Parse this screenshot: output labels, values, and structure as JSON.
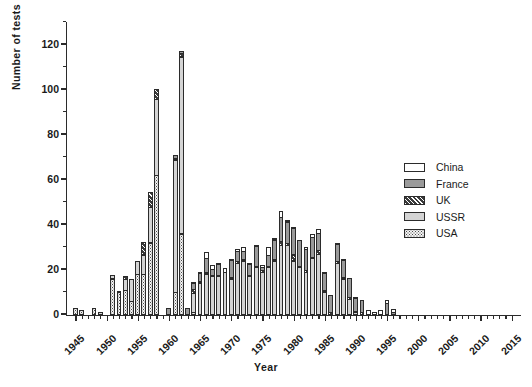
{
  "chart_data": {
    "type": "bar",
    "subtype": "stacked-bar",
    "title": "",
    "xlabel": "Year",
    "ylabel": "Number of tests",
    "xlim": [
      1943.5,
      2016.5
    ],
    "ylim": [
      0,
      130
    ],
    "y_major_ticks": [
      0,
      20,
      40,
      60,
      80,
      100,
      120
    ],
    "y_minor_tick_step": 10,
    "x_tick_labels": [
      "1945",
      "1950",
      "1955",
      "1960",
      "1965",
      "1970",
      "1975",
      "1980",
      "1985",
      "1990",
      "1995",
      "2000",
      "2005",
      "2010",
      "2015"
    ],
    "x_tick_step": 5,
    "x_minor_tick_step": 1,
    "grid": false,
    "legend_position": "right",
    "series": [
      {
        "name": "China",
        "pattern": "open-white",
        "color": "#ffffff",
        "values": {
          "1964": 1,
          "1965": 1,
          "1966": 3,
          "1967": 2,
          "1968": 1,
          "1969": 2,
          "1970": 1,
          "1971": 1,
          "1972": 2,
          "1973": 1,
          "1974": 1,
          "1975": 1,
          "1976": 4,
          "1977": 1,
          "1978": 3,
          "1979": 1,
          "1980": 1,
          "1982": 1,
          "1983": 2,
          "1984": 2,
          "1985": 1,
          "1987": 1,
          "1988": 1,
          "1990": 1,
          "1992": 2,
          "1993": 1,
          "1994": 2,
          "1995": 2,
          "1996": 2
        }
      },
      {
        "name": "France",
        "pattern": "solid-gray",
        "color": "#9a9a9a",
        "values": {
          "1960": 3,
          "1961": 2,
          "1962": 1,
          "1963": 3,
          "1964": 3,
          "1965": 4,
          "1966": 7,
          "1967": 3,
          "1968": 5,
          "1969": 0,
          "1970": 8,
          "1971": 5,
          "1972": 4,
          "1973": 5,
          "1974": 9,
          "1975": 2,
          "1976": 5,
          "1977": 9,
          "1978": 11,
          "1979": 10,
          "1980": 12,
          "1981": 12,
          "1982": 10,
          "1983": 9,
          "1984": 8,
          "1985": 8,
          "1986": 8,
          "1987": 8,
          "1988": 8,
          "1989": 9,
          "1990": 6,
          "1991": 6,
          "1995": 5,
          "1996": 1
        }
      },
      {
        "name": "UK",
        "pattern": "diagonal-hatch-dark",
        "color": "#3a3a3a",
        "values": {
          "1952": 1,
          "1953": 2,
          "1956": 6,
          "1957": 7,
          "1958": 5,
          "1961": 1,
          "1962": 2,
          "1963": 0,
          "1964": 2,
          "1965": 1,
          "1966": 1,
          "1967": 1,
          "1968": 1,
          "1970": 1,
          "1971": 1,
          "1972": 1,
          "1973": 1,
          "1974": 1,
          "1975": 1,
          "1976": 1,
          "1977": 1,
          "1978": 2,
          "1979": 1,
          "1980": 3,
          "1981": 1,
          "1982": 1,
          "1983": 1,
          "1984": 2,
          "1985": 1,
          "1986": 1,
          "1987": 1,
          "1988": 1,
          "1989": 1,
          "1990": 1,
          "1991": 1
        }
      },
      {
        "name": "USSR",
        "pattern": "light-gray",
        "color": "#d4d4d4",
        "values": {
          "1949": 1,
          "1951": 2,
          "1953": 5,
          "1954": 10,
          "1955": 6,
          "1956": 9,
          "1957": 16,
          "1958": 34,
          "1961": 59,
          "1962": 79,
          "1963": 0,
          "1964": 9,
          "1965": 14,
          "1966": 18,
          "1967": 17,
          "1968": 17,
          "1969": 19,
          "1970": 16,
          "1971": 23,
          "1972": 24,
          "1973": 17,
          "1974": 21,
          "1975": 19,
          "1976": 21,
          "1977": 24,
          "1978": 31,
          "1979": 31,
          "1980": 24,
          "1981": 21,
          "1982": 19,
          "1983": 25,
          "1984": 27,
          "1985": 10,
          "1987": 23,
          "1988": 16,
          "1989": 7,
          "1990": 1
        }
      },
      {
        "name": "USA",
        "pattern": "fine-dot",
        "color": "#f2f2f2",
        "values": {
          "1945": 3,
          "1946": 2,
          "1948": 3,
          "1949": 0,
          "1951": 16,
          "1952": 10,
          "1953": 11,
          "1954": 6,
          "1955": 18,
          "1956": 18,
          "1957": 32,
          "1958": 62,
          "1959": 0,
          "1960": 0,
          "1961": 10,
          "1962": 36,
          "1963": 0,
          "1964": 1,
          "1965": 0,
          "1966": 0,
          "1967": 0,
          "1968": 0,
          "1969": 0,
          "1970": 0,
          "1971": 0,
          "1972": 0,
          "1973": 0,
          "1974": 0,
          "1975": 0,
          "1976": 0
        }
      }
    ],
    "annotations": [
      {
        "year": 1958,
        "total": 102,
        "note": "secondary peak"
      },
      {
        "year": 1962,
        "total": 118,
        "note": "overall peak"
      }
    ]
  },
  "legend": {
    "items": [
      {
        "label": "China",
        "series_key": "China"
      },
      {
        "label": "France",
        "series_key": "France"
      },
      {
        "label": "UK",
        "series_key": "UK"
      },
      {
        "label": "USSR",
        "series_key": "USSR"
      },
      {
        "label": "USA",
        "series_key": "USA"
      }
    ]
  },
  "axes": {
    "y_title": "Number of tests",
    "x_title": "Year"
  }
}
